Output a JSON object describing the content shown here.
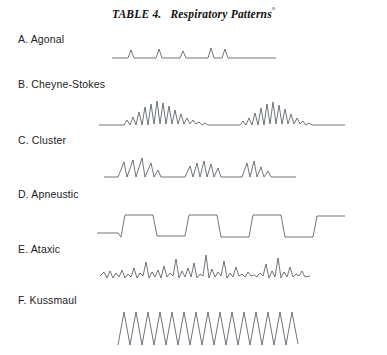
{
  "figure": {
    "title_table": "TABLE 4.",
    "title_main": "Respiratory Patterns",
    "title_footnote_marker": "°",
    "ink_color": "#555c63",
    "background_color": "#ffffff"
  },
  "patterns": [
    {
      "key": "agonal",
      "label": "A. Agonal",
      "label_x": 18,
      "label_y": 33,
      "baseline_y": 58,
      "description": "Flat baseline interrupted by isolated irregular gasps"
    },
    {
      "key": "cheyne-stokes",
      "label": "B. Cheyne-Stokes",
      "label_x": 18,
      "label_y": 78,
      "baseline_y": 125,
      "description": "Crescendo-decrescendo oscillation alternating with apnea"
    },
    {
      "key": "cluster",
      "label": "C. Cluster",
      "label_x": 18,
      "label_y": 134,
      "baseline_y": 177,
      "description": "Groups of breaths separated by irregular pauses"
    },
    {
      "key": "apneustic",
      "label": "D. Apneustic",
      "label_x": 18,
      "label_y": 188,
      "baseline_y": 237,
      "description": "Prolonged inspiratory plateaus, square-wave appearance"
    },
    {
      "key": "ataxic",
      "label": "E. Ataxic",
      "label_x": 18,
      "label_y": 243,
      "baseline_y": 276,
      "description": "Completely irregular rate and amplitude"
    },
    {
      "key": "kussmaul",
      "label": "F. Kussmaul",
      "label_x": 18,
      "label_y": 294,
      "baseline_y": 330,
      "description": "Deep, rapid, regular high-amplitude breathing"
    }
  ],
  "chart_data": {
    "type": "line",
    "xlabel": "",
    "ylabel": "",
    "grid": false,
    "legend_position": "none",
    "note": "Six respiratory waveform traces; x is time in pixels, y is pixel row (smaller y = larger inspiration).",
    "series": [
      {
        "name": "A. Agonal",
        "points": [
          [
            112,
            58
          ],
          [
            128,
            58
          ],
          [
            131,
            50
          ],
          [
            134,
            58
          ],
          [
            156,
            58
          ],
          [
            159,
            49
          ],
          [
            162,
            58
          ],
          [
            180,
            58
          ],
          [
            183,
            51
          ],
          [
            186,
            58
          ],
          [
            208,
            58
          ],
          [
            211,
            48
          ],
          [
            214,
            58
          ],
          [
            222,
            58
          ],
          [
            225,
            49
          ],
          [
            228,
            58
          ],
          [
            276,
            58
          ]
        ]
      },
      {
        "name": "B. Cheyne-Stokes",
        "points": [
          [
            99,
            125
          ],
          [
            124,
            125
          ],
          [
            127,
            120
          ],
          [
            130,
            125
          ],
          [
            133,
            117
          ],
          [
            136,
            125
          ],
          [
            139,
            112
          ],
          [
            142,
            125
          ],
          [
            145,
            107
          ],
          [
            148,
            125
          ],
          [
            151,
            104
          ],
          [
            154,
            124
          ],
          [
            157,
            101
          ],
          [
            160,
            124
          ],
          [
            163,
            103
          ],
          [
            166,
            124
          ],
          [
            169,
            106
          ],
          [
            172,
            124
          ],
          [
            175,
            110
          ],
          [
            178,
            124
          ],
          [
            181,
            114
          ],
          [
            184,
            124
          ],
          [
            187,
            118
          ],
          [
            190,
            124
          ],
          [
            193,
            120
          ],
          [
            196,
            124
          ],
          [
            199,
            122
          ],
          [
            202,
            125
          ],
          [
            205,
            123
          ],
          [
            208,
            125
          ],
          [
            216,
            125
          ],
          [
            240,
            125
          ],
          [
            243,
            121
          ],
          [
            246,
            125
          ],
          [
            249,
            118
          ],
          [
            252,
            125
          ],
          [
            255,
            113
          ],
          [
            258,
            125
          ],
          [
            261,
            108
          ],
          [
            264,
            125
          ],
          [
            267,
            104
          ],
          [
            270,
            124
          ],
          [
            273,
            102
          ],
          [
            276,
            124
          ],
          [
            279,
            105
          ],
          [
            282,
            124
          ],
          [
            285,
            109
          ],
          [
            288,
            124
          ],
          [
            291,
            114
          ],
          [
            294,
            124
          ],
          [
            297,
            118
          ],
          [
            300,
            124
          ],
          [
            303,
            121
          ],
          [
            306,
            125
          ],
          [
            309,
            123
          ],
          [
            312,
            125
          ],
          [
            345,
            125
          ]
        ]
      },
      {
        "name": "C. Cluster",
        "points": [
          [
            104,
            177
          ],
          [
            118,
            177
          ],
          [
            124,
            162
          ],
          [
            127,
            177
          ],
          [
            133,
            160
          ],
          [
            136,
            177
          ],
          [
            142,
            158
          ],
          [
            145,
            177
          ],
          [
            151,
            163
          ],
          [
            154,
            177
          ],
          [
            158,
            170
          ],
          [
            161,
            177
          ],
          [
            168,
            177
          ],
          [
            185,
            177
          ],
          [
            190,
            166
          ],
          [
            193,
            177
          ],
          [
            197,
            163
          ],
          [
            200,
            177
          ],
          [
            204,
            161
          ],
          [
            207,
            177
          ],
          [
            211,
            164
          ],
          [
            214,
            177
          ],
          [
            218,
            168
          ],
          [
            221,
            177
          ],
          [
            226,
            177
          ],
          [
            242,
            177
          ],
          [
            247,
            163
          ],
          [
            250,
            177
          ],
          [
            254,
            161
          ],
          [
            257,
            177
          ],
          [
            261,
            167
          ],
          [
            264,
            177
          ],
          [
            268,
            171
          ],
          [
            271,
            177
          ],
          [
            296,
            177
          ]
        ]
      },
      {
        "name": "D. Apneustic",
        "points": [
          [
            97,
            233
          ],
          [
            118,
            233
          ],
          [
            121,
            237
          ],
          [
            125,
            215
          ],
          [
            153,
            215
          ],
          [
            157,
            236
          ],
          [
            185,
            236
          ],
          [
            189,
            215
          ],
          [
            217,
            215
          ],
          [
            221,
            237
          ],
          [
            249,
            237
          ],
          [
            253,
            215
          ],
          [
            281,
            215
          ],
          [
            285,
            237
          ],
          [
            313,
            237
          ],
          [
            317,
            216
          ],
          [
            345,
            216
          ]
        ]
      },
      {
        "name": "E. Ataxic",
        "points": [
          [
            100,
            276
          ],
          [
            104,
            272
          ],
          [
            107,
            278
          ],
          [
            110,
            271
          ],
          [
            113,
            278
          ],
          [
            116,
            273
          ],
          [
            119,
            277
          ],
          [
            122,
            270
          ],
          [
            125,
            278
          ],
          [
            128,
            274
          ],
          [
            131,
            277
          ],
          [
            134,
            268
          ],
          [
            137,
            278
          ],
          [
            140,
            273
          ],
          [
            143,
            276
          ],
          [
            146,
            262
          ],
          [
            149,
            278
          ],
          [
            152,
            272
          ],
          [
            155,
            277
          ],
          [
            158,
            270
          ],
          [
            161,
            278
          ],
          [
            164,
            266
          ],
          [
            167,
            277
          ],
          [
            170,
            273
          ],
          [
            173,
            276
          ],
          [
            176,
            259
          ],
          [
            179,
            278
          ],
          [
            182,
            271
          ],
          [
            185,
            277
          ],
          [
            188,
            268
          ],
          [
            191,
            277
          ],
          [
            194,
            263
          ],
          [
            197,
            278
          ],
          [
            200,
            274
          ],
          [
            203,
            276
          ],
          [
            206,
            255
          ],
          [
            209,
            278
          ],
          [
            212,
            269
          ],
          [
            215,
            277
          ],
          [
            218,
            272
          ],
          [
            221,
            276
          ],
          [
            224,
            261
          ],
          [
            227,
            278
          ],
          [
            230,
            273
          ],
          [
            233,
            277
          ],
          [
            236,
            267
          ],
          [
            239,
            276
          ],
          [
            242,
            274
          ],
          [
            245,
            277
          ],
          [
            248,
            272
          ],
          [
            251,
            276
          ],
          [
            254,
            275
          ],
          [
            257,
            277
          ],
          [
            260,
            273
          ],
          [
            263,
            276
          ],
          [
            266,
            264
          ],
          [
            269,
            278
          ],
          [
            272,
            271
          ],
          [
            275,
            277
          ],
          [
            278,
            258
          ],
          [
            281,
            278
          ],
          [
            284,
            272
          ],
          [
            287,
            277
          ],
          [
            290,
            267
          ],
          [
            293,
            277
          ],
          [
            296,
            274
          ],
          [
            299,
            276
          ],
          [
            302,
            271
          ],
          [
            305,
            277
          ],
          [
            310,
            276
          ]
        ]
      },
      {
        "name": "F. Kussmaul",
        "points": [
          [
            118,
            345
          ],
          [
            124,
            312
          ],
          [
            130,
            345
          ],
          [
            136,
            312
          ],
          [
            142,
            345
          ],
          [
            148,
            312
          ],
          [
            154,
            345
          ],
          [
            160,
            312
          ],
          [
            166,
            345
          ],
          [
            172,
            312
          ],
          [
            178,
            345
          ],
          [
            184,
            312
          ],
          [
            190,
            345
          ],
          [
            196,
            312
          ],
          [
            202,
            345
          ],
          [
            208,
            312
          ],
          [
            214,
            345
          ],
          [
            220,
            312
          ],
          [
            226,
            345
          ],
          [
            232,
            312
          ],
          [
            238,
            345
          ],
          [
            244,
            312
          ],
          [
            250,
            345
          ],
          [
            256,
            312
          ],
          [
            262,
            345
          ],
          [
            268,
            312
          ],
          [
            274,
            345
          ],
          [
            280,
            312
          ],
          [
            286,
            345
          ],
          [
            292,
            312
          ],
          [
            298,
            344
          ]
        ]
      }
    ]
  }
}
